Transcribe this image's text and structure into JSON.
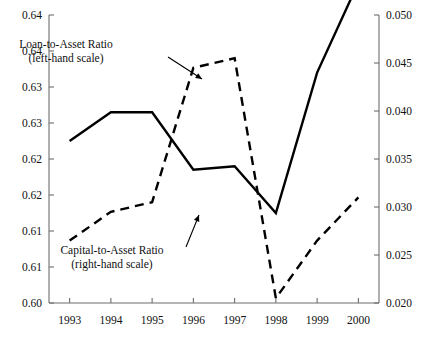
{
  "chart_data": {
    "type": "line",
    "title": "",
    "xlabel": "",
    "categories": [
      "1993",
      "1994",
      "1995",
      "1996",
      "1997",
      "1998",
      "1999",
      "2000"
    ],
    "grid": false,
    "legend_position": "inline-annotations",
    "left_axis": {
      "label": "",
      "ylim": [
        0.6,
        0.64
      ],
      "ticks": [
        0.6,
        0.605,
        0.61,
        0.615,
        0.62,
        0.625,
        0.63,
        0.635,
        0.64
      ],
      "tick_labels": [
        "0.60",
        "0.61",
        "0.61",
        "0.62",
        "0.62",
        "0.63",
        "0.63",
        "0.64",
        "0.64"
      ]
    },
    "right_axis": {
      "label": "",
      "ylim": [
        0.02,
        0.05
      ],
      "ticks": [
        0.02,
        0.025,
        0.03,
        0.035,
        0.04,
        0.045,
        0.05
      ],
      "tick_labels": [
        "0.020",
        "0.025",
        "0.030",
        "0.035",
        "0.040",
        "0.045",
        "0.050"
      ]
    },
    "series": [
      {
        "name": "Loan-to-Asset Ratio",
        "axis": "left",
        "style": "solid",
        "color": "#000000",
        "values": [
          0.6225,
          0.6265,
          0.6265,
          0.6185,
          0.619,
          0.6125,
          0.632,
          0.6445
        ]
      },
      {
        "name": "Capital-to-Asset Ratio",
        "axis": "right",
        "style": "dashed",
        "color": "#000000",
        "values": [
          0.0265,
          0.0295,
          0.0305,
          0.0445,
          0.0455,
          0.0205,
          0.0265,
          0.031
        ]
      }
    ],
    "annotations": [
      {
        "name": "loan-to-asset-annotation",
        "line1": "Loan-to-Asset Ratio",
        "line2": "(left-hand scale)",
        "x": 66,
        "y": 48,
        "arrow": {
          "x1": 168,
          "y1": 57,
          "x2": 202,
          "y2": 79
        }
      },
      {
        "name": "capital-to-asset-annotation",
        "line1": "Capital-to-Asset Ratio",
        "line2": "(right-hand scale)",
        "x": 112,
        "y": 254,
        "arrow": {
          "x1": 186,
          "y1": 247,
          "x2": 199,
          "y2": 215
        }
      }
    ]
  }
}
